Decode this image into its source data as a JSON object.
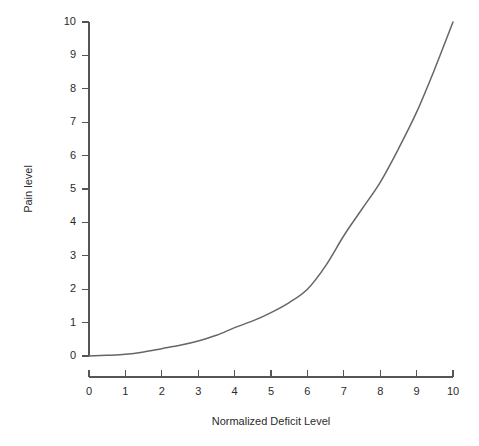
{
  "chart_data": {
    "type": "line",
    "title": "",
    "subtitle": "",
    "xlabel": "Normalized Deficit Level",
    "ylabel": "Pain level",
    "xlim": [
      0,
      10
    ],
    "ylim": [
      0,
      10
    ],
    "xticks": [
      "0",
      "1",
      "2",
      "3",
      "4",
      "5",
      "6",
      "7",
      "8",
      "9",
      "10"
    ],
    "yticks": [
      "0",
      "1",
      "2",
      "3",
      "4",
      "5",
      "6",
      "7",
      "8",
      "9",
      "10"
    ],
    "grid": false,
    "legend": null,
    "legend_position": "none",
    "annotations": [],
    "series": [
      {
        "name": "Pain level",
        "color": "#666666",
        "x": [
          0,
          0.5,
          1,
          1.5,
          2,
          2.5,
          3,
          3.5,
          4,
          4.5,
          5,
          5.5,
          6,
          6.5,
          7,
          7.5,
          8,
          8.5,
          9,
          9.5,
          10
        ],
        "values": [
          0,
          0.02,
          0.05,
          0.12,
          0.22,
          0.32,
          0.45,
          0.62,
          0.85,
          1.05,
          1.3,
          1.6,
          2.0,
          2.7,
          3.6,
          4.4,
          5.2,
          6.2,
          7.3,
          8.6,
          10
        ]
      }
    ]
  },
  "axes": {
    "x_title": "Normalized Deficit Level",
    "y_title": "Pain level",
    "x_tick_labels": [
      "0",
      "1",
      "2",
      "3",
      "4",
      "5",
      "6",
      "7",
      "8",
      "9",
      "10"
    ],
    "y_tick_labels": [
      "0",
      "1",
      "2",
      "3",
      "4",
      "5",
      "6",
      "7",
      "8",
      "9",
      "10"
    ]
  },
  "style": {
    "line_color": "#666666",
    "axis_color": "#555555",
    "text_color": "#2b2b2b",
    "background": "#ffffff"
  }
}
